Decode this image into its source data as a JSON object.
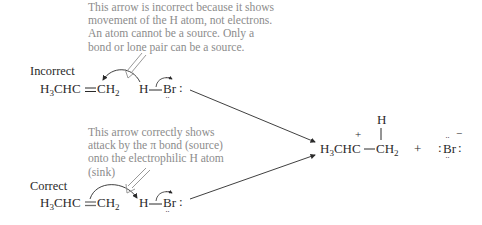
{
  "notes": {
    "incorrect_explanation": [
      "This arrow is incorrect because it shows",
      "movement of the H atom, not electrons.",
      "An atom cannot be a source. Only a",
      "bond or lone pair can be a source."
    ],
    "correct_explanation": [
      "This arrow correctly shows",
      "attack by the π bond (source)",
      "onto the electrophilic H atom",
      "(sink)"
    ]
  },
  "incorrect": {
    "label": "Incorrect",
    "alkene_left": "H",
    "alkene_left_sub": "3",
    "alkene_left_rest": "CHC",
    "alkene_right": "CH",
    "alkene_right_sub": "2",
    "hbr_h": "H",
    "hbr_br": "Br",
    "hbr_colon": ":"
  },
  "correct": {
    "label": "Correct",
    "alkene_left": "H",
    "alkene_left_sub": "3",
    "alkene_left_rest": "CHC",
    "alkene_right": "CH",
    "alkene_right_sub": "2",
    "hbr_h": "H",
    "hbr_br": "Br",
    "hbr_colon": ":"
  },
  "product": {
    "cation_left": "H",
    "cation_left_sub": "3",
    "cation_left_rest": "CHC",
    "cation_charge": "+",
    "cation_right": "CH",
    "cation_right_sub": "2",
    "added_h": "H",
    "plus_sign": "+",
    "bromide_colon_left": ":",
    "bromide": "Br",
    "bromide_colon_right": ":",
    "bromide_charge": "−",
    "lone_pair_dots": "··"
  },
  "colors": {
    "note_text": "#8c8c8c",
    "main_text": "#2a2a2a",
    "double_bond_highlight": "#7a7a7a"
  }
}
